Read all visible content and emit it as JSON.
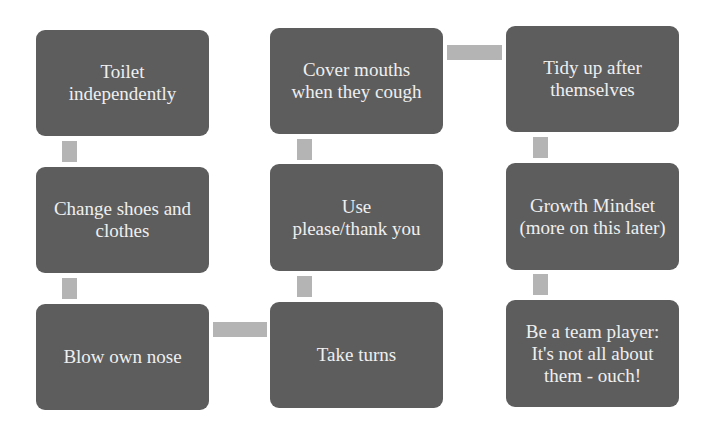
{
  "diagram": {
    "colors": {
      "box_fill": "#5d5d5d",
      "box_text": "#efefef",
      "connector": "#b4b4b4",
      "background": "#ffffff"
    },
    "nodes": [
      {
        "id": "n1",
        "label": "Toilet independently"
      },
      {
        "id": "n2",
        "label": "Change shoes and clothes"
      },
      {
        "id": "n3",
        "label": "Blow own nose"
      },
      {
        "id": "n4",
        "label": "Take turns"
      },
      {
        "id": "n5",
        "label": "Use please/thank you"
      },
      {
        "id": "n6",
        "label": "Cover mouths when they cough"
      },
      {
        "id": "n7",
        "label": "Tidy up after themselves"
      },
      {
        "id": "n8",
        "label": "Growth Mindset (more on this later)"
      },
      {
        "id": "n9",
        "label": "Be a team player: It's not all about them - ouch!"
      }
    ],
    "edges": [
      [
        "n1",
        "n2"
      ],
      [
        "n2",
        "n3"
      ],
      [
        "n3",
        "n4"
      ],
      [
        "n4",
        "n5"
      ],
      [
        "n5",
        "n6"
      ],
      [
        "n6",
        "n7"
      ],
      [
        "n7",
        "n8"
      ],
      [
        "n8",
        "n9"
      ]
    ]
  }
}
